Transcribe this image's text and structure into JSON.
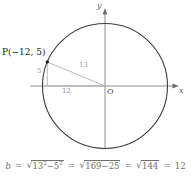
{
  "figure": {
    "type": "coordinate-plane-circle-diagram",
    "axes": {
      "x_label": "x",
      "y_label": "y",
      "origin_label": "O"
    },
    "point": {
      "label": "P(−12, 5)",
      "x": -12,
      "y": 5
    },
    "segments": [
      {
        "name": "horizontal-leg",
        "label": "12",
        "length": 12
      },
      {
        "name": "vertical-leg",
        "label": "5",
        "length": 5
      },
      {
        "name": "hypotenuse-radius",
        "label": "13",
        "length": 13
      }
    ],
    "circle": {
      "radius": 13,
      "center_label": "O"
    },
    "colors": {
      "circle_stroke": "#3d3d3d",
      "axis_stroke": "#8f8f8f",
      "helper_stroke": "#b4b4b4",
      "text": "#231f20",
      "muted_text": "#9a9a9a",
      "equation_text": "#6f6f6f"
    }
  },
  "equation": {
    "lhs": "b",
    "eq1": "=",
    "term1": {
      "radicand_base1": "13",
      "exp1": "2",
      "minus": "−",
      "radicand_base2": "5",
      "exp2": "2"
    },
    "eq2": "=",
    "term2": "169−25",
    "eq3": "=",
    "term3": "144",
    "eq4": "=",
    "result": "12"
  }
}
